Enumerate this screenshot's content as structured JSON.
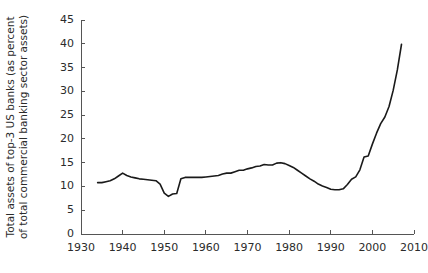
{
  "chart_data": {
    "type": "line",
    "title": "",
    "xlabel": "",
    "ylabel_line1": "Total assets of top-3 US banks (as percent",
    "ylabel_line2": "of total commercial banking sector assets)",
    "xlim": [
      1930,
      2010
    ],
    "ylim": [
      0,
      45
    ],
    "xticks": [
      1930,
      1940,
      1950,
      1960,
      1970,
      1980,
      1990,
      2000,
      2010
    ],
    "yticks": [
      0,
      5,
      10,
      15,
      20,
      25,
      30,
      35,
      40,
      45
    ],
    "grid": false,
    "legend": "none",
    "line_color": "#1a1a1a",
    "axis_color": "#555555",
    "background_color": "#ffffff",
    "series": [
      {
        "name": "Top-3 US banks asset share",
        "x": [
          1934,
          1935,
          1936,
          1937,
          1938,
          1939,
          1940,
          1941,
          1942,
          1943,
          1944,
          1945,
          1946,
          1947,
          1948,
          1949,
          1950,
          1951,
          1952,
          1953,
          1954,
          1955,
          1956,
          1957,
          1958,
          1959,
          1960,
          1961,
          1962,
          1963,
          1964,
          1965,
          1966,
          1967,
          1968,
          1969,
          1970,
          1971,
          1972,
          1973,
          1974,
          1975,
          1976,
          1977,
          1978,
          1979,
          1980,
          1981,
          1982,
          1983,
          1984,
          1985,
          1986,
          1987,
          1988,
          1989,
          1990,
          1991,
          1992,
          1993,
          1994,
          1995,
          1996,
          1997,
          1998,
          1999,
          2000,
          2001,
          2002,
          2003,
          2004,
          2005,
          2006,
          2007
        ],
        "y": [
          10.8,
          10.8,
          11.0,
          11.2,
          11.6,
          12.2,
          12.8,
          12.3,
          12.0,
          11.8,
          11.6,
          11.5,
          11.4,
          11.3,
          11.2,
          10.5,
          8.6,
          7.9,
          8.4,
          8.5,
          11.6,
          11.9,
          11.9,
          11.9,
          11.9,
          11.9,
          12.0,
          12.1,
          12.2,
          12.3,
          12.6,
          12.8,
          12.8,
          13.1,
          13.4,
          13.4,
          13.7,
          13.9,
          14.2,
          14.3,
          14.6,
          14.5,
          14.5,
          14.9,
          15.0,
          14.8,
          14.4,
          14.0,
          13.4,
          12.8,
          12.2,
          11.6,
          11.1,
          10.5,
          10.1,
          9.8,
          9.4,
          9.3,
          9.3,
          9.5,
          10.4,
          11.5,
          12.0,
          13.5,
          16.2,
          16.4,
          18.9,
          21.2,
          23.2,
          24.6,
          26.8,
          30.2,
          34.5,
          39.9
        ]
      }
    ]
  },
  "axes": {
    "x_tick_labels": [
      "1930",
      "1940",
      "1950",
      "1960",
      "1970",
      "1980",
      "1990",
      "2000",
      "2010"
    ],
    "y_tick_labels": [
      "0",
      "5",
      "10",
      "15",
      "20",
      "25",
      "30",
      "35",
      "40",
      "45"
    ]
  }
}
